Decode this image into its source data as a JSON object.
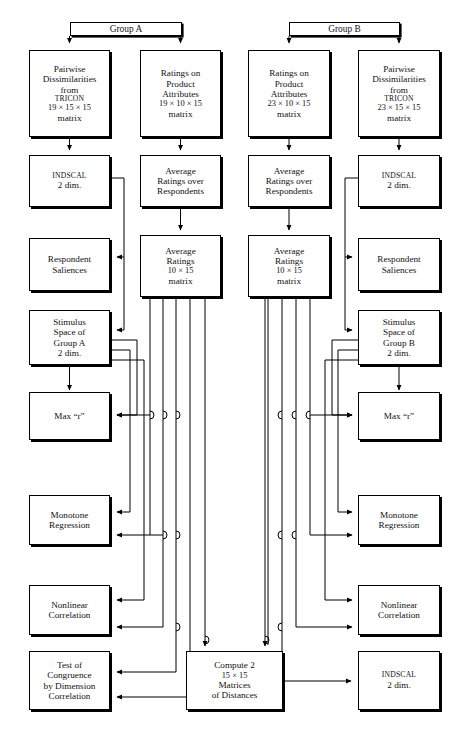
{
  "figure": {
    "type": "flowchart",
    "groups": [
      {
        "id": "group-a",
        "label": "Group A"
      },
      {
        "id": "group-b",
        "label": "Group B"
      }
    ],
    "nodes": [
      {
        "id": "a-pairwise",
        "column": 1,
        "lines": [
          "Pairwise",
          "Dissimilarities",
          "from TRICON",
          "19 × 15 × 15",
          "matrix"
        ],
        "smallcaps_line": 2
      },
      {
        "id": "a-ratings",
        "column": 2,
        "lines": [
          "Ratings on",
          "Product",
          "Attributes",
          "19 × 10 × 15",
          "matrix"
        ]
      },
      {
        "id": "b-ratings",
        "column": 3,
        "lines": [
          "Ratings on",
          "Product",
          "Attributes",
          "23 × 10 × 15",
          "matrix"
        ]
      },
      {
        "id": "b-pairwise",
        "column": 4,
        "lines": [
          "Pairwise",
          "Dissimilarities",
          "from TRICON",
          "23 × 15 × 15",
          "matrix"
        ],
        "smallcaps_line": 2
      },
      {
        "id": "a-indscal",
        "column": 1,
        "lines": [
          "INDSCAL",
          "2 dim."
        ],
        "smallcaps_line": 0
      },
      {
        "id": "a-avg-over",
        "column": 2,
        "lines": [
          "Average",
          "Ratings over",
          "Respondents"
        ]
      },
      {
        "id": "b-avg-over",
        "column": 3,
        "lines": [
          "Average",
          "Ratings over",
          "Respondents"
        ]
      },
      {
        "id": "b-indscal",
        "column": 4,
        "lines": [
          "INDSCAL",
          "2 dim."
        ],
        "smallcaps_line": 0
      },
      {
        "id": "a-saliences",
        "column": 1,
        "lines": [
          "Respondent",
          "Saliences"
        ]
      },
      {
        "id": "a-avg-matrix",
        "column": 2,
        "lines": [
          "Average",
          "Ratings",
          "10 × 15",
          "matrix"
        ]
      },
      {
        "id": "b-avg-matrix",
        "column": 3,
        "lines": [
          "Average",
          "Ratings",
          "10 × 15",
          "matrix"
        ]
      },
      {
        "id": "b-saliences",
        "column": 4,
        "lines": [
          "Respondent",
          "Saliences"
        ]
      },
      {
        "id": "a-stimulus",
        "column": 1,
        "lines": [
          "Stimulus",
          "Space of",
          "Group A",
          "2 dim."
        ]
      },
      {
        "id": "b-stimulus",
        "column": 4,
        "lines": [
          "Stimulus",
          "Space of",
          "Group B",
          "2 dim."
        ]
      },
      {
        "id": "a-maxr",
        "column": 1,
        "lines": [
          "Max “r”"
        ]
      },
      {
        "id": "b-maxr",
        "column": 4,
        "lines": [
          "Max “r”"
        ]
      },
      {
        "id": "a-monotone",
        "column": 1,
        "lines": [
          "Monotone",
          "Regression"
        ]
      },
      {
        "id": "b-monotone",
        "column": 4,
        "lines": [
          "Monotone",
          "Regression"
        ]
      },
      {
        "id": "a-nonlinear",
        "column": 1,
        "lines": [
          "Nonlinear",
          "Correlation"
        ]
      },
      {
        "id": "b-nonlinear",
        "column": 4,
        "lines": [
          "Nonlinear",
          "Correlation"
        ]
      },
      {
        "id": "a-congruence",
        "column": 1,
        "lines": [
          "Test of",
          "Congruence",
          "by Dimension",
          "Correlation"
        ]
      },
      {
        "id": "compute-distances",
        "column": "center",
        "lines": [
          "Compute 2",
          "15 × 15",
          "Matrices",
          "of Distances"
        ]
      },
      {
        "id": "final-indscal",
        "column": 4,
        "lines": [
          "INDSCAL",
          "2 dim."
        ],
        "smallcaps_line": 0
      }
    ],
    "colors": {
      "stroke": "#000000",
      "box_fill": "#ffffff",
      "background": "#ffffff",
      "shadow": "#000000"
    }
  }
}
